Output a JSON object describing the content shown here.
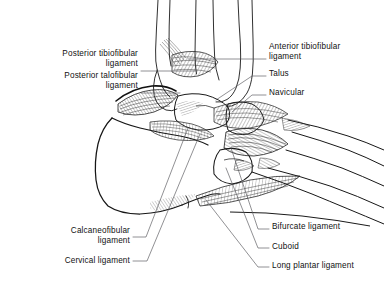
{
  "figure": {
    "kind": "anatomical-line-drawing",
    "style": "black ink line art with hatched ligament fibers on white background",
    "ink_color": "#1a1a1a",
    "background_color": "#ffffff",
    "leader_line_color": "#55555a"
  },
  "labels": {
    "posterior_tibiofibular": {
      "text": "Posterior tibiofibular\nligament",
      "align": "right",
      "x": 16,
      "y": 49,
      "width": 122
    },
    "posterior_talofibular": {
      "text": "Posterior talofibular\nligament",
      "align": "right",
      "x": 16,
      "y": 71,
      "width": 122
    },
    "anterior_tibiofibular": {
      "text": "Anterior tibiofibular\nligament",
      "align": "left",
      "x": 269,
      "y": 42,
      "width": 115
    },
    "talus": {
      "text": "Talus",
      "align": "left",
      "x": 269,
      "y": 69,
      "width": 100
    },
    "navicular": {
      "text": "Navicular",
      "align": "left",
      "x": 269,
      "y": 88,
      "width": 100
    },
    "calcaneofibular": {
      "text": "Calcaneofibular\nligament",
      "align": "right",
      "x": 20,
      "y": 226,
      "width": 110
    },
    "cervical": {
      "text": "Cervical ligament",
      "align": "right",
      "x": 20,
      "y": 256,
      "width": 110
    },
    "bifurcate": {
      "text": "Bifurcate ligament",
      "align": "left",
      "x": 272,
      "y": 222,
      "width": 112
    },
    "cuboid": {
      "text": "Cuboid",
      "align": "left",
      "x": 272,
      "y": 242,
      "width": 112
    },
    "long_plantar": {
      "text": "Long plantar ligament",
      "align": "left",
      "x": 272,
      "y": 261,
      "width": 112
    }
  }
}
